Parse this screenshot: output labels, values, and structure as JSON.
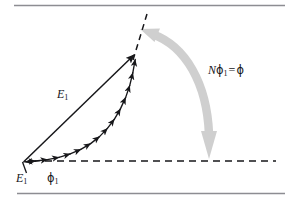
{
  "figure": {
    "kind": "phasor-addition-diagram",
    "background_color": "#ffffff",
    "ink_color": "#17171a",
    "rule_color": "#8d8d92",
    "gray_arrow_color": "#cfcfcf",
    "rules": {
      "top_y": 5,
      "bottom_y": 193,
      "x_start": 14,
      "x_end": 285
    },
    "geometry": {
      "origin": [
        23,
        162
      ],
      "arc_tip": [
        136,
        53
      ],
      "tangent_dashed_end": [
        147,
        14
      ],
      "baseline_dashed": {
        "x_start": 45,
        "x_end": 276,
        "y": 161
      },
      "small_arrow_count": 12
    }
  },
  "labels": {
    "resultant_vector": {
      "symbol": "E",
      "subscript": "1"
    },
    "origin_vector": {
      "symbol": "E",
      "subscript": "1"
    },
    "phase_increment": {
      "symbol": "ϕ",
      "subscript": "1"
    },
    "total_phase": {
      "factor": "N",
      "symbol": "ϕ",
      "subscript": "1",
      "equals": "=",
      "result": "ϕ"
    }
  },
  "icons": {
    "resultant_arrow": "arrow-up-right-icon",
    "chain_arrow": "small-arrow-icon",
    "gray_double_arrow": "curved-double-arrow-icon",
    "dashed_tangent": "dashed-line-icon",
    "dashed_baseline": "dashed-line-icon",
    "leader_line": "leader-line-icon"
  }
}
